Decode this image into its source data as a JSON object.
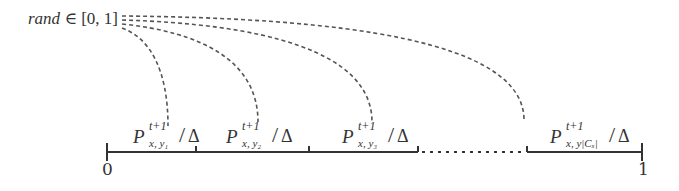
{
  "diagram": {
    "source_label": "rand ∈ [0, 1]",
    "source_label_parts": {
      "var": "rand",
      "rest": " ∈ [0, 1]"
    },
    "segments": [
      {
        "label": "P^{t+1}_{x,y_1}/Δ",
        "P": "P",
        "sup": "t+1",
        "sub": "x, y₁",
        "slash": "/",
        "delta": "Δ"
      },
      {
        "label": "P^{t+1}_{x,y_2}/Δ",
        "P": "P",
        "sup": "t+1",
        "sub": "x, y₂",
        "slash": "/",
        "delta": "Δ"
      },
      {
        "label": "P^{t+1}_{x,y_3}/Δ",
        "P": "P",
        "sup": "t+1",
        "sub": "x, y₃",
        "slash": "/",
        "delta": "Δ"
      },
      {
        "label": "P^{t+1}_{x,y_{|C_x|}}/Δ",
        "P": "P",
        "sup": "t+1",
        "sub": "x, y|Cₓ|",
        "slash": "/",
        "delta": "Δ"
      }
    ],
    "axis": {
      "start_label": "0",
      "end_label": "1"
    },
    "colors": {
      "line": "#333333",
      "dashed": "#555555"
    }
  }
}
